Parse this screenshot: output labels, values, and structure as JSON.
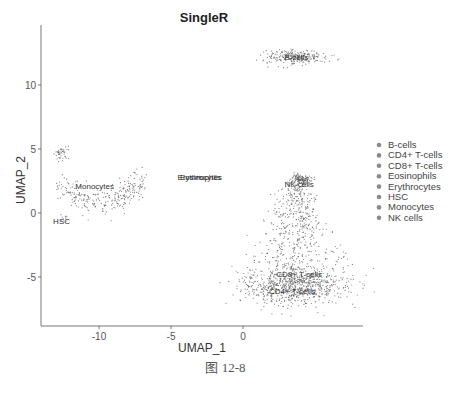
{
  "chart_data": {
    "type": "scatter",
    "title": "SingleR",
    "xlabel": "UMAP_1",
    "ylabel": "UMAP_2",
    "xlim": [
      -14,
      8.3
    ],
    "ylim": [
      -8.8,
      14.6
    ],
    "xticks": [
      -10,
      -5,
      0
    ],
    "yticks": [
      -5,
      0,
      5,
      10
    ],
    "grid": false,
    "legend_position": "right",
    "legend": [
      "B-cells",
      "CD4+ T-cells",
      "CD8+ T-cells",
      "Eosinophils",
      "Erythrocytes",
      "HSC",
      "Monocytes",
      "NK cells"
    ],
    "clusters": [
      {
        "name": "B-cells",
        "label_x": 3.7,
        "label_y": 12.2,
        "center": [
          3.7,
          12.2
        ],
        "spread": [
          1.9,
          0.5
        ],
        "n": 260,
        "shape": "ellipse"
      },
      {
        "name": "Monocytes",
        "label_x": -10.3,
        "label_y": 2.1,
        "center": [
          -10.0,
          2.3
        ],
        "spread": [
          2.6,
          1.6
        ],
        "n": 320,
        "shape": "crescent"
      },
      {
        "name": "HSC",
        "label_x": -12.6,
        "label_y": -0.6,
        "center": [
          -12.3,
          -0.4
        ],
        "spread": [
          0.5,
          0.3
        ],
        "n": 10,
        "shape": "ellipse"
      },
      {
        "name": "Erythrocytes",
        "label_x": -3.0,
        "label_y": 2.8,
        "center": [
          -3.0,
          2.8
        ],
        "spread": [
          0.1,
          0.1
        ],
        "n": 3,
        "shape": "ellipse"
      },
      {
        "name": "Eosinophils",
        "label_x": -3.0,
        "label_y": 2.8,
        "center": [
          -3.0,
          2.8
        ],
        "spread": [
          0.1,
          0.1
        ],
        "n": 2,
        "shape": "ellipse"
      },
      {
        "name": "NK cells",
        "label_x": 3.9,
        "label_y": 2.3,
        "center": [
          4.0,
          2.6
        ],
        "spread": [
          0.6,
          0.4
        ],
        "n": 150,
        "shape": "ellipse"
      },
      {
        "name": "CD8+ T-cells",
        "label_x": 3.9,
        "label_y": -4.8,
        "center": [
          3.7,
          -3.0
        ],
        "spread": [
          1.5,
          2.0
        ],
        "n": 450,
        "shape": "stem"
      },
      {
        "name": "CD4+ T-cells",
        "label_x": 3.4,
        "label_y": -6.1,
        "center": [
          3.6,
          -5.6
        ],
        "spread": [
          3.0,
          1.5
        ],
        "n": 900,
        "shape": "ellipse"
      }
    ]
  },
  "caption": "图 12-8"
}
